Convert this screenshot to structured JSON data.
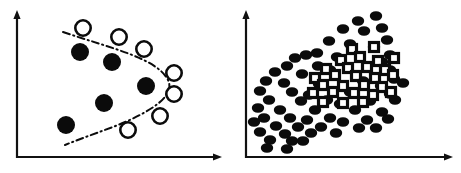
{
  "figure": {
    "width": 461,
    "height": 173,
    "background": "#ffffff",
    "ink_color": "#0b0b0b",
    "panel_count": 2
  },
  "chart_data": [
    {
      "id": "left-panel",
      "type": "scatter",
      "title": "",
      "subtitle": "",
      "xlabel": "",
      "ylabel": "",
      "grid": false,
      "legend": false,
      "axes": {
        "style": "two-axis-arrows",
        "origin_px": [
          17,
          157
        ],
        "x_axis_end_px": [
          220,
          157
        ],
        "y_axis_end_px": [
          17,
          14
        ],
        "xlim": [
          0,
          1
        ],
        "ylim": [
          0,
          1
        ],
        "xticks": [],
        "yticks": []
      },
      "series": [
        {
          "name": "class-filled",
          "marker": "filled-circle",
          "fill": "#0b0b0b",
          "radius_px": 9,
          "points_px": [
            [
              80,
              52
            ],
            [
              112,
              62
            ],
            [
              146,
              86
            ],
            [
              104,
              103
            ],
            [
              66,
              125
            ]
          ]
        },
        {
          "name": "class-open",
          "marker": "open-circle",
          "fill": "#ffffff",
          "stroke": "#0b0b0b",
          "radius_px": 9,
          "points_px": [
            [
              83,
              28
            ],
            [
              119,
              37
            ],
            [
              144,
              49
            ],
            [
              174,
              73
            ],
            [
              174,
              94
            ],
            [
              160,
              116
            ],
            [
              128,
              130
            ]
          ]
        }
      ],
      "annotations": [
        {
          "name": "decision-boundary",
          "style": "dash-dot",
          "stroke": "#0b0b0b",
          "path_px": "M63,32 C110,48 157,58 168,80 C176,96 150,112 118,125 C100,132 82,138 65,145"
        }
      ]
    },
    {
      "id": "right-panel",
      "type": "scatter",
      "title": "",
      "subtitle": "",
      "xlabel": "",
      "ylabel": "",
      "grid": false,
      "legend": false,
      "axes": {
        "style": "two-axis-arrows",
        "origin_px": [
          16,
          157
        ],
        "x_axis_end_px": [
          221,
          157
        ],
        "y_axis_end_px": [
          16,
          14
        ],
        "xlim": [
          0,
          1
        ],
        "ylim": [
          0,
          1
        ],
        "xticks": [],
        "yticks": []
      },
      "series": [
        {
          "name": "outer-cloud",
          "marker": "filled-ellipse",
          "fill": "#0b0b0b",
          "rx_px": 6.2,
          "ry_px": 4.8,
          "count": 66,
          "points_px": [
            [
              128,
              21
            ],
            [
              146,
              16
            ],
            [
              113,
              29
            ],
            [
              134,
              31
            ],
            [
              152,
              28
            ],
            [
              99,
              41
            ],
            [
              120,
              44
            ],
            [
              144,
              47
            ],
            [
              157,
              40
            ],
            [
              87,
              53
            ],
            [
              107,
              57
            ],
            [
              160,
              55
            ],
            [
              152,
              62
            ],
            [
              65,
              58
            ],
            [
              76,
              55
            ],
            [
              57,
              66
            ],
            [
              88,
              66
            ],
            [
              100,
              70
            ],
            [
              160,
              70
            ],
            [
              45,
              72
            ],
            [
              72,
              74
            ],
            [
              164,
              79
            ],
            [
              36,
              81
            ],
            [
              54,
              83
            ],
            [
              89,
              84
            ],
            [
              133,
              81
            ],
            [
              151,
              86
            ],
            [
              173,
              83
            ],
            [
              30,
              91
            ],
            [
              62,
              92
            ],
            [
              79,
              95
            ],
            [
              120,
              92
            ],
            [
              160,
              94
            ],
            [
              39,
              100
            ],
            [
              71,
              101
            ],
            [
              97,
              100
            ],
            [
              110,
              104
            ],
            [
              140,
              101
            ],
            [
              165,
              100
            ],
            [
              28,
              108
            ],
            [
              50,
              110
            ],
            [
              85,
              110
            ],
            [
              125,
              110
            ],
            [
              152,
              112
            ],
            [
              34,
              118
            ],
            [
              60,
              118
            ],
            [
              77,
              120
            ],
            [
              100,
              118
            ],
            [
              113,
              122
            ],
            [
              137,
              120
            ],
            [
              158,
              119
            ],
            [
              24,
              122
            ],
            [
              46,
              126
            ],
            [
              68,
              127
            ],
            [
              91,
              127
            ],
            [
              129,
              128
            ],
            [
              146,
              128
            ],
            [
              30,
              132
            ],
            [
              55,
              134
            ],
            [
              81,
              133
            ],
            [
              106,
              133
            ],
            [
              40,
              140
            ],
            [
              62,
              141
            ],
            [
              37,
              148
            ],
            [
              57,
              149
            ],
            [
              73,
              141
            ]
          ]
        },
        {
          "name": "inner-cluster",
          "marker": "open-square",
          "fill": "#ffffff",
          "stroke": "#0b0b0b",
          "size_px": 9,
          "count": 27,
          "points_px": [
            [
              122,
              49
            ],
            [
              144,
              47
            ],
            [
              111,
              60
            ],
            [
              130,
              57
            ],
            [
              148,
              61
            ],
            [
              164,
              58
            ],
            [
              96,
              69
            ],
            [
              118,
              68
            ],
            [
              137,
              67
            ],
            [
              155,
              70
            ],
            [
              85,
              78
            ],
            [
              105,
              75
            ],
            [
              126,
              76
            ],
            [
              145,
              78
            ],
            [
              163,
              75
            ],
            [
              93,
              85
            ],
            [
              113,
              86
            ],
            [
              134,
              85
            ],
            [
              152,
              87
            ],
            [
              83,
              93
            ],
            [
              103,
              92
            ],
            [
              124,
              93
            ],
            [
              143,
              95
            ],
            [
              161,
              92
            ],
            [
              93,
              102
            ],
            [
              113,
              103
            ],
            [
              133,
              102
            ]
          ]
        }
      ],
      "annotations": []
    }
  ]
}
